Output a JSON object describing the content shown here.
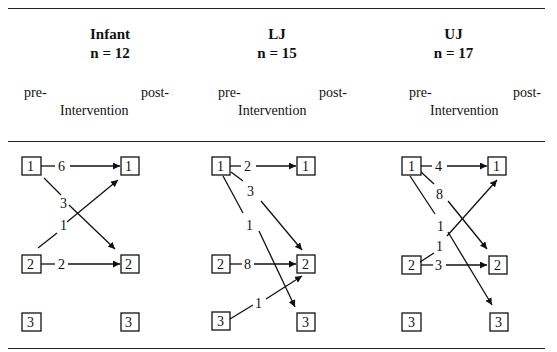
{
  "panels": [
    {
      "group": "Infant",
      "n_label": "n = 12",
      "pre": "pre-",
      "post": "post-",
      "axis": "Intervention",
      "transitions": [
        {
          "from": 1,
          "to": 1,
          "count": "6"
        },
        {
          "from": 1,
          "to": 2,
          "count": "3"
        },
        {
          "from": 2,
          "to": 1,
          "count": "1"
        },
        {
          "from": 2,
          "to": 2,
          "count": "2"
        }
      ]
    },
    {
      "group": "LJ",
      "n_label": "n = 15",
      "pre": "pre-",
      "post": "post-",
      "axis": "Intervention",
      "transitions": [
        {
          "from": 1,
          "to": 1,
          "count": "2"
        },
        {
          "from": 1,
          "to": 2,
          "count": "3"
        },
        {
          "from": 1,
          "to": 3,
          "count": "1"
        },
        {
          "from": 2,
          "to": 2,
          "count": "8"
        },
        {
          "from": 3,
          "to": 2,
          "count": "1"
        }
      ]
    },
    {
      "group": "UJ",
      "n_label": "n = 17",
      "pre": "pre-",
      "post": "post-",
      "axis": "Intervention",
      "transitions": [
        {
          "from": 1,
          "to": 1,
          "count": "4"
        },
        {
          "from": 1,
          "to": 2,
          "count": "8"
        },
        {
          "from": 1,
          "to": 3,
          "count": "1"
        },
        {
          "from": 2,
          "to": 1,
          "count": "1"
        },
        {
          "from": 2,
          "to": 2,
          "count": "3"
        }
      ]
    }
  ],
  "node_labels": [
    "1",
    "2",
    "3"
  ]
}
